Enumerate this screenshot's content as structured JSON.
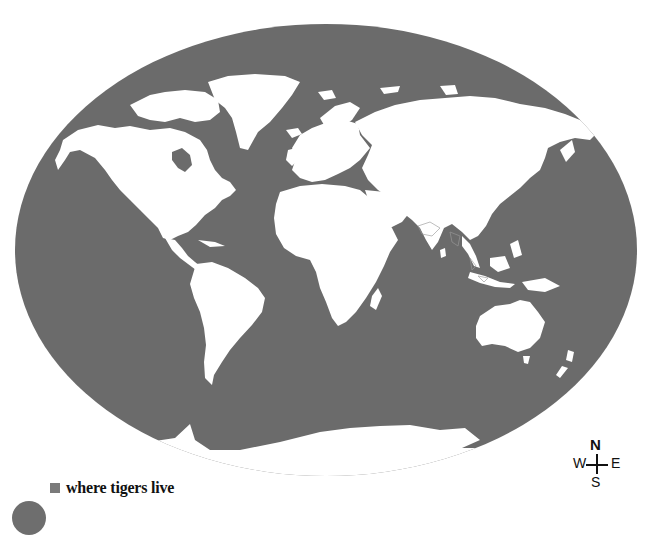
{
  "map": {
    "projection": "oval world map",
    "ocean_color": "#6b6b6b",
    "land_color": "#ffffff",
    "tiger_region_color": "#7a7a7a",
    "continents": [
      "North America",
      "Greenland",
      "South America",
      "Europe",
      "Africa",
      "Asia",
      "Australia",
      "New Zealand",
      "Antarctica"
    ]
  },
  "legend": {
    "swatch_color": "#7a7a7a",
    "label": "where tigers live"
  },
  "compass": {
    "north": "N",
    "south": "S",
    "east": "E",
    "west": "W"
  }
}
